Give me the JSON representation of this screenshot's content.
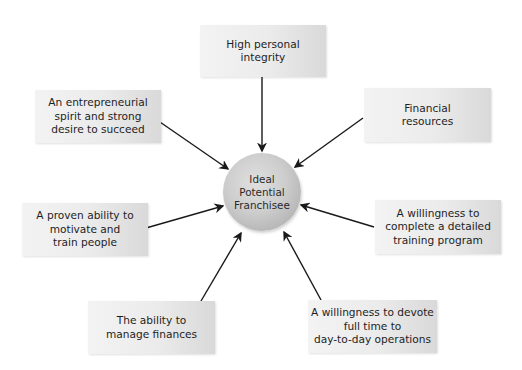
{
  "diagram": {
    "center": {
      "label": "Ideal\nPotential\nFranchisee",
      "fill_light": "#e0e0e0",
      "fill_dark": "#a2a2a2"
    },
    "nodes": [
      {
        "id": "integrity",
        "label": "High personal\nintegrity"
      },
      {
        "id": "financial-resources",
        "label": "Financial\nresources"
      },
      {
        "id": "entrepreneurial",
        "label": "An entrepreneurial\nspirit and strong\ndesire to succeed"
      },
      {
        "id": "motivate",
        "label": "A proven ability to\nmotivate and\ntrain people"
      },
      {
        "id": "training",
        "label": "A willingness to\ncomplete a detailed\ntraining program"
      },
      {
        "id": "manage-finances",
        "label": "The ability to\nmanage finances"
      },
      {
        "id": "devote-time",
        "label": "A willingness to devote\nfull time to\nday-to-day operations"
      }
    ],
    "edges": [
      {
        "from": "integrity",
        "to": "center"
      },
      {
        "from": "financial-resources",
        "to": "center"
      },
      {
        "from": "entrepreneurial",
        "to": "center"
      },
      {
        "from": "motivate",
        "to": "center"
      },
      {
        "from": "training",
        "to": "center"
      },
      {
        "from": "manage-finances",
        "to": "center"
      },
      {
        "from": "devote-time",
        "to": "center"
      }
    ],
    "colors": {
      "arrow": "#1a1a1a",
      "box_light": "#f3f3f3",
      "box_dark": "#d9d9d9",
      "text": "#1e1e1e"
    }
  }
}
